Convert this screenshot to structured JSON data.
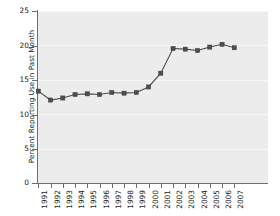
{
  "chart_data": {
    "type": "line",
    "title": "",
    "xlabel": "",
    "ylabel": "Percent Reporting Use in Past Month",
    "x": [
      1991,
      1992,
      1993,
      1994,
      1995,
      1996,
      1997,
      1998,
      1999,
      2000,
      2001,
      2002,
      2003,
      2004,
      2005,
      2006,
      2007
    ],
    "values": [
      13.4,
      12.1,
      12.4,
      12.9,
      13.0,
      12.9,
      13.2,
      13.1,
      13.2,
      14.0,
      16.0,
      19.6,
      19.5,
      19.3,
      19.8,
      20.2,
      19.7
    ],
    "categories": [
      "1991",
      "1992",
      "1993",
      "1994",
      "1995",
      "1996",
      "1997",
      "1998",
      "1999",
      "2000",
      "2001",
      "2002",
      "2003",
      "2004",
      "2005",
      "2006",
      "2007"
    ],
    "ylim": [
      0,
      25
    ],
    "yticks": [
      0,
      5,
      10,
      15,
      20,
      25
    ],
    "ytick_labels": [
      "0",
      "5",
      "10",
      "15",
      "20",
      "25"
    ],
    "grid": true,
    "legend": false,
    "marker": "square",
    "series_color": "#4d4d4d",
    "plot_background": "#ececed"
  },
  "axes": {
    "y_title": "Percent Reporting Use in Past Month"
  }
}
